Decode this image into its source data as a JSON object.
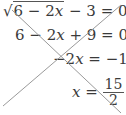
{
  "equations": [
    {
      "radical_sign": "√",
      "radicand_a": "6 − 2",
      "var": "x",
      "rest": " − 3 = 0"
    },
    {
      "a": "6 − 2",
      "var": "x",
      "rest": " + 9 = 0"
    },
    {
      "lhs_a": "−2",
      "var": "x",
      "rest": " = −15"
    },
    {
      "var": "x",
      "eq": " = ",
      "numerator": "15",
      "denominator": "2"
    }
  ],
  "strike_color": "#9a9a9a",
  "text_color": "#3a3a3a"
}
